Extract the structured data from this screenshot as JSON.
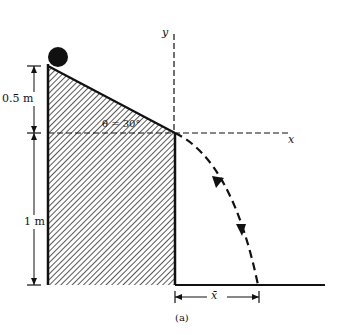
{
  "figure": {
    "caption": "(a)",
    "height_upper_label": "0.5 m",
    "height_lower_label": "1 m",
    "angle_label": "θ = 30°",
    "x_axis_label": "x",
    "y_axis_label": "y",
    "range_label": "x̄"
  },
  "colors": {
    "ink": "#111111",
    "background": "#ffffff"
  }
}
